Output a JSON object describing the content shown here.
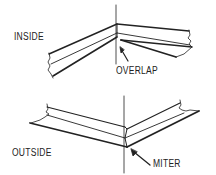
{
  "diagram": {
    "type": "corner-joint-illustration",
    "line_color": "#222222",
    "background": "#ffffff",
    "panels": [
      {
        "id": "inside",
        "label": "INSIDE",
        "callout": "OVERLAP",
        "description": "Inside corner joint where flanges overlap"
      },
      {
        "id": "outside",
        "label": "OUTSIDE",
        "callout": "MITER",
        "description": "Outside corner joint with mitered flanges"
      }
    ]
  }
}
